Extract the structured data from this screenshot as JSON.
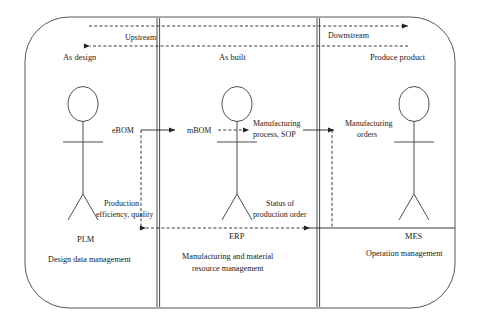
{
  "diagram": {
    "direction": {
      "upstream_label": "Upstream",
      "downstream_label": "Downstream"
    },
    "lanes": [
      {
        "id": "plm",
        "phase_label": "As design",
        "system_name": "PLM",
        "system_description": "Design data management"
      },
      {
        "id": "erp",
        "phase_label": "As built",
        "system_name": "ERP",
        "system_description_line1": "Manufacturing and material",
        "system_description_line2": "resource management"
      },
      {
        "id": "mes",
        "phase_label": "Produce product",
        "system_name": "MES",
        "system_description": "Operation management"
      }
    ],
    "flows": [
      {
        "id": "ebom",
        "label": "eBOM",
        "style": "solid"
      },
      {
        "id": "mbom",
        "label": "mBOM",
        "style": "dashed"
      },
      {
        "id": "mfg_process",
        "label_line1": "Manufacturing",
        "label_line2": "process, SOP",
        "style": "solid"
      },
      {
        "id": "mfg_orders",
        "label_line1": "Manufacturing",
        "label_line2": "orders",
        "style": "solid"
      },
      {
        "id": "status",
        "label_line1": "Status of",
        "label_line2": "production order",
        "style": "solid"
      },
      {
        "id": "efficiency",
        "label_line1": "Production",
        "label_line2": "efficiency, quality",
        "style": "dashed"
      }
    ],
    "colors": {
      "outline": "#555555",
      "lane_divider": "#4a4a4a",
      "actor": "#3a3a3a",
      "arrow": "#222222",
      "text": "#1a1a1a",
      "background": "#ffffff"
    }
  }
}
